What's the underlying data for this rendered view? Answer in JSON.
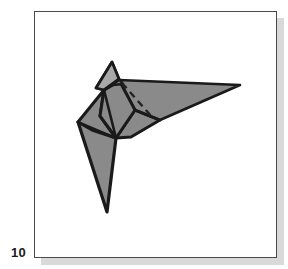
{
  "figure": {
    "number_label": "10",
    "caption": "",
    "panel": {
      "border_color": "#4a4a4a",
      "background_color": "#ffffff",
      "shadow_color": "#d9d9d9"
    },
    "illustration": {
      "name": "origami-crane-diagram",
      "description": "Folded paper origami bird in three-quarter view with a pointed head at upper left, a long narrow wing sweeping to the right, and a long tapered tail pointing down",
      "colors": {
        "body_fill": "#8a8a8a",
        "highlight_fill": "#a9a9a9",
        "shade_fill": "#7c7c7c",
        "outline": "#1a1a1a",
        "fold_line": "#2b2b2b",
        "crease_dash": "#232323"
      },
      "parts": [
        {
          "name": "head",
          "fill": "#a9a9a9",
          "points": "112,62 96,88 104,90 119,79"
        },
        {
          "name": "neck-gusset",
          "fill": "#7c7c7c",
          "points": "112,62 119,79 123,84 113,85 104,90 96,88"
        },
        {
          "name": "upper-wing",
          "fill": "#8a8a8a",
          "points": "119,80 240,85 160,120 135,110"
        },
        {
          "name": "lower-wing",
          "fill": "#8a8a8a",
          "points": "135,110 160,120 131,137 116,138"
        },
        {
          "name": "body-upper",
          "fill": "#8a8a8a",
          "points": "104,90 119,80 135,110 116,138 100,116"
        },
        {
          "name": "left-flap",
          "fill": "#8a8a8a",
          "points": "104,90 100,116 116,138 92,130 78,122"
        },
        {
          "name": "tail",
          "fill": "#8a8a8a",
          "points": "78,122 116,138 107,212"
        }
      ],
      "fold_lines": [
        {
          "name": "wing-crease",
          "x1": 135,
          "y1": 110,
          "x2": 160,
          "y2": 120
        },
        {
          "name": "body-crease",
          "x1": 104,
          "y1": 90,
          "x2": 116,
          "y2": 138
        },
        {
          "name": "flap-crease",
          "x1": 78,
          "y1": 122,
          "x2": 116,
          "y2": 138
        },
        {
          "name": "neck-crease",
          "x1": 104,
          "y1": 90,
          "x2": 119,
          "y2": 80
        }
      ],
      "dashed_crease": {
        "name": "hidden-fold",
        "x1": 122,
        "y1": 83,
        "x2": 152,
        "y2": 117
      }
    }
  }
}
